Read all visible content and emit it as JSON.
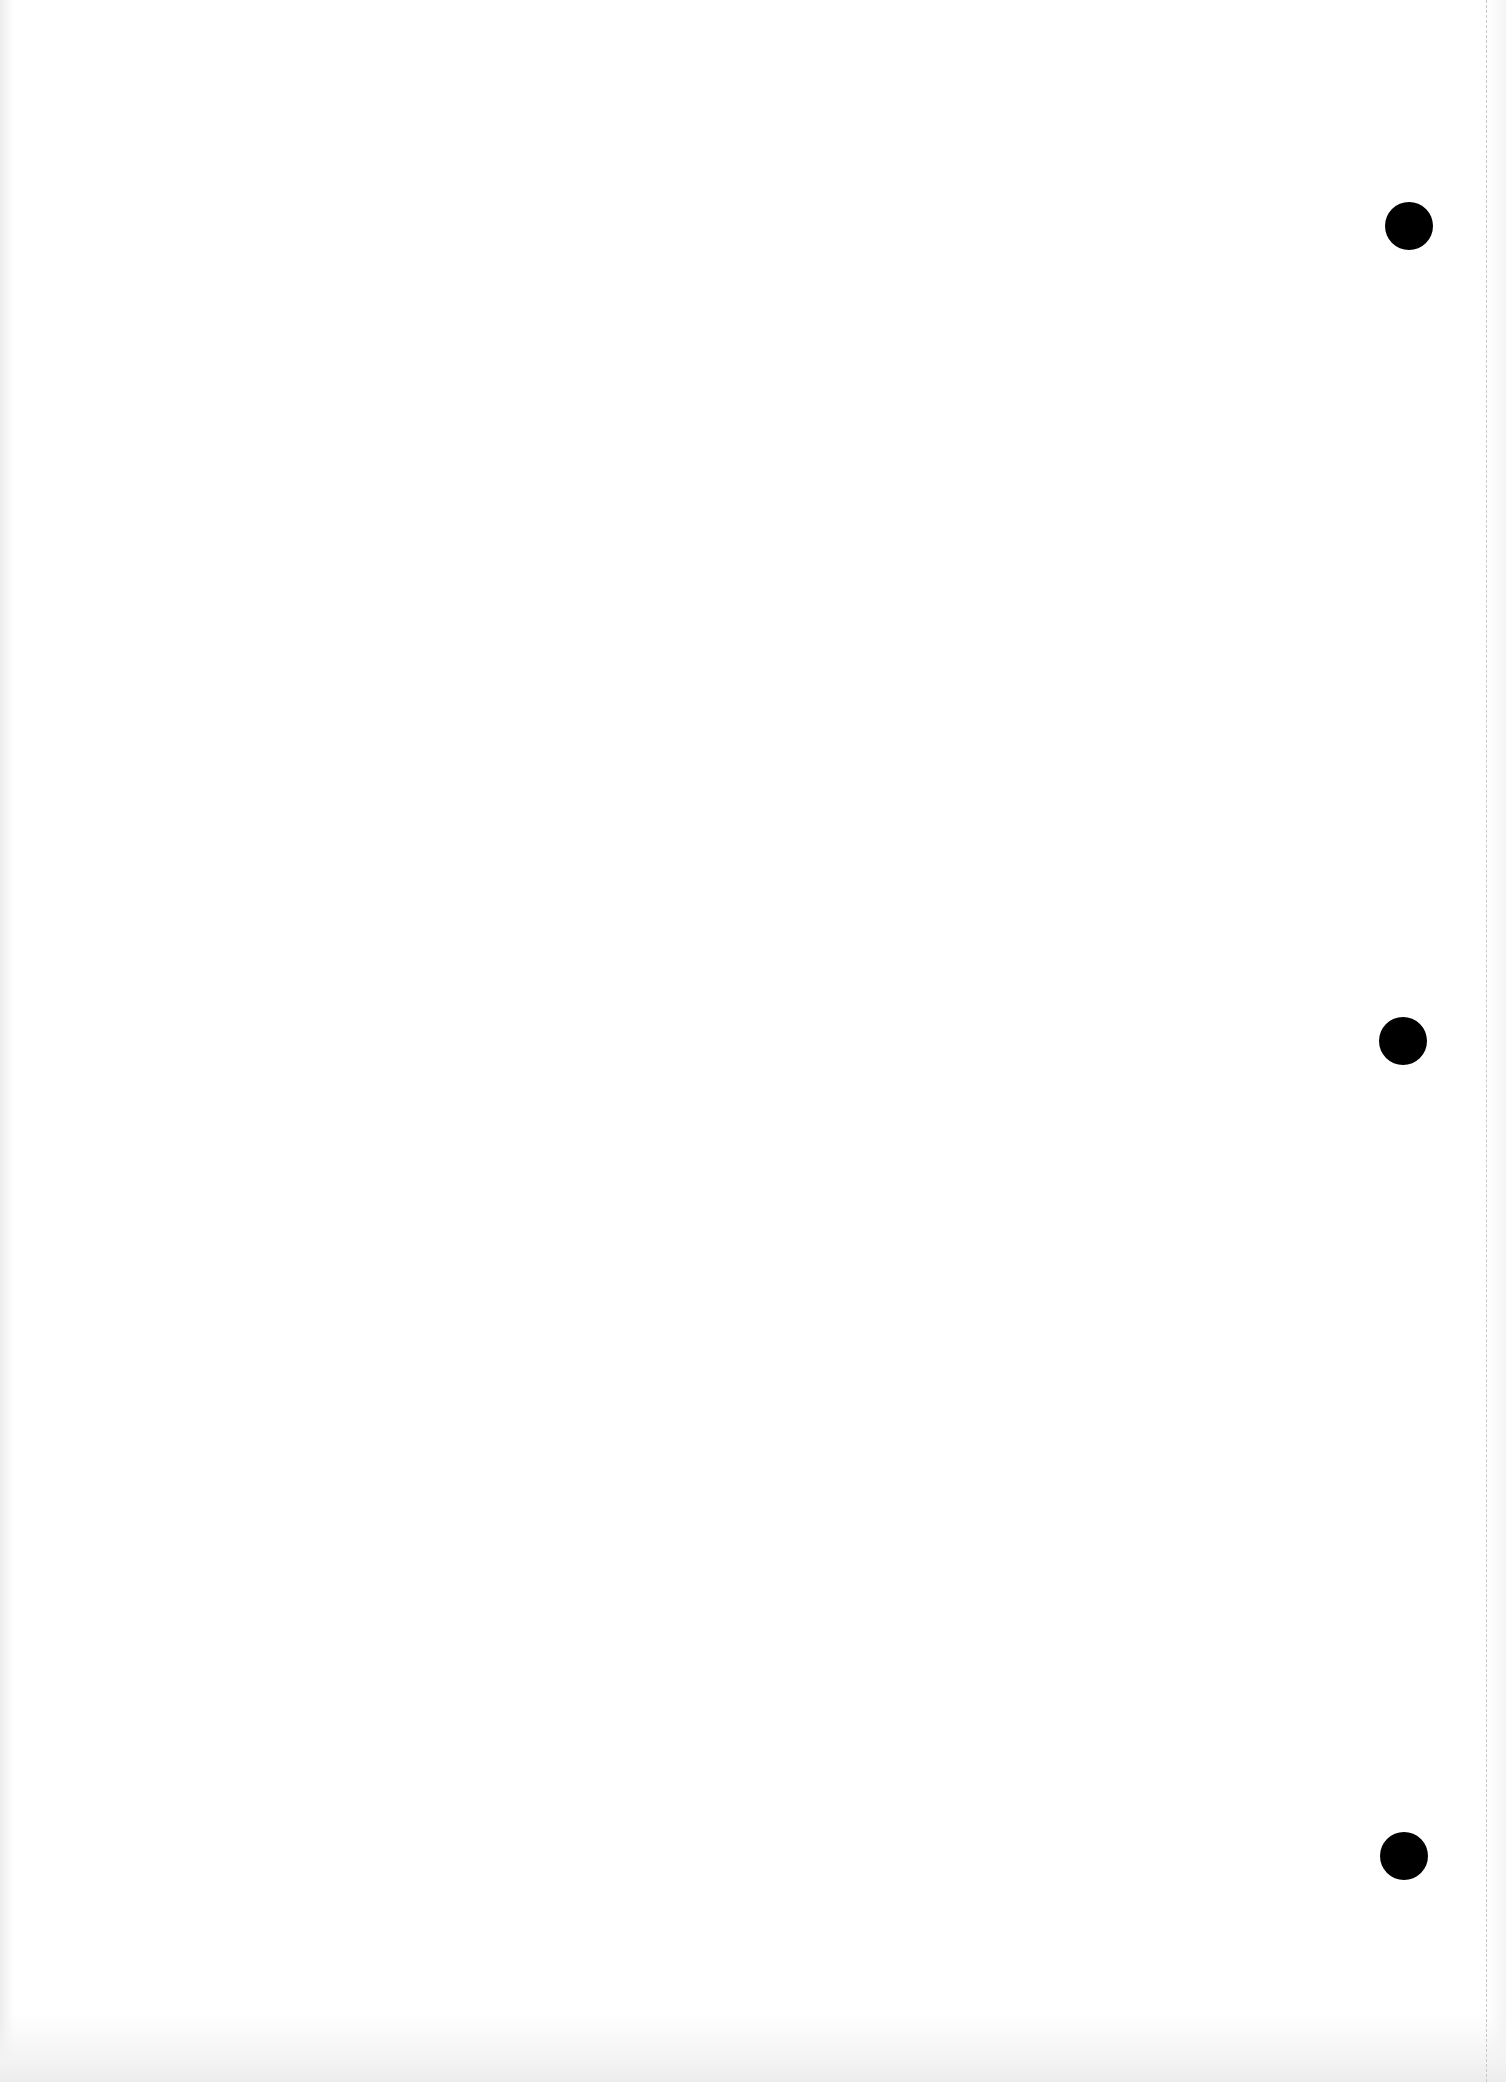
{
  "page": {
    "width": 1506,
    "height": 2082,
    "background_color": "#ffffff",
    "text_content": []
  },
  "perforation_line": {
    "x": 1486,
    "style": "dashed",
    "color": "#c8c8c8"
  },
  "punch_holes": [
    {
      "cx": 1409,
      "cy": 226,
      "r": 24,
      "color": "#000000"
    },
    {
      "cx": 1403,
      "cy": 1041,
      "r": 24,
      "color": "#000000"
    },
    {
      "cx": 1404,
      "cy": 1856,
      "r": 24,
      "color": "#000000"
    }
  ]
}
